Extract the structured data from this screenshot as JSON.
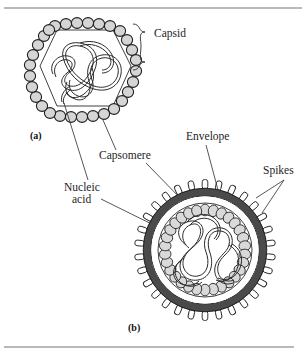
{
  "figure": {
    "background_color": "#ffffff",
    "rule_color": "#b9b9b9",
    "top_rule_y": 8,
    "bottom_rule_y": 347
  },
  "panels": [
    {
      "letter": "(a)",
      "description": "Naked virus with hexagonal capsid",
      "letter_x": 30,
      "letter_y": 139
    },
    {
      "letter": "(b)",
      "description": "Enveloped virus with spikes",
      "letter_x": 128,
      "letter_y": 331
    }
  ],
  "labels": [
    {
      "id": "capsid",
      "text": "Capsid",
      "x": 154,
      "y": 37,
      "anchor": "start",
      "connector": "brace"
    },
    {
      "id": "capsomere",
      "text": "Capsomere",
      "x": 99,
      "y": 159,
      "anchor": "start",
      "connector": "leader"
    },
    {
      "id": "nucleic-acid-line1",
      "text": "Nucleic",
      "x": 64,
      "y": 191,
      "anchor": "start",
      "connector": "leader"
    },
    {
      "id": "nucleic-acid-line2",
      "text": "acid",
      "x": 72,
      "y": 203,
      "anchor": "start",
      "connector": "none"
    },
    {
      "id": "envelope",
      "text": "Envelope",
      "x": 186,
      "y": 140,
      "anchor": "start",
      "connector": "leader"
    },
    {
      "id": "spikes",
      "text": "Spikes",
      "x": 263,
      "y": 174,
      "anchor": "start",
      "connector": "leader"
    }
  ],
  "diagram_a": {
    "name": "naked-virus",
    "center_x": 85,
    "center_y": 72,
    "capsomere_count": 30,
    "capsomere_radius_x": 5.4,
    "capsomere_radius_y": 5.4,
    "capsomere_fill": "#d5d5d5",
    "capsomere_stroke": "#1f1f1f",
    "hex_radius": 54,
    "nucleic_acid_stroke": "#2a2a2a"
  },
  "diagram_b": {
    "name": "enveloped-virus",
    "center_x": 205,
    "center_y": 250,
    "envelope_radius": 62,
    "envelope_color": "#4a4a4a",
    "envelope_thickness": 7.5,
    "spike_count": 30,
    "spike_length": 9,
    "spike_width": 5,
    "spike_fill": "#ffffff",
    "capsid_radius": 47,
    "capsomere_ring_radius": 40,
    "capsomere_count": 30,
    "capsomere_fill": "#d9d9d9",
    "nucleic_acid_stroke": "#2a2a2a"
  }
}
